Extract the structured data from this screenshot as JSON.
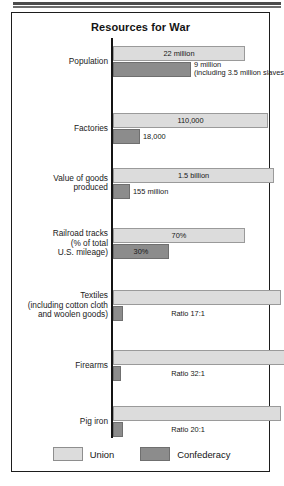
{
  "figure": {
    "title": "Resources for War"
  },
  "legend": {
    "position": "bottom-center",
    "items": [
      {
        "label": "Union",
        "color": "#dcdcdc",
        "name": "union"
      },
      {
        "label": "Confederacy",
        "color": "#8c8c8c",
        "name": "confederacy"
      }
    ]
  },
  "chart_data": {
    "type": "bar",
    "orientation": "horizontal",
    "title": "Resources for War",
    "xlabel": "",
    "ylabel": "",
    "grid": false,
    "legend_position": "bottom-center",
    "series": [
      {
        "name": "Union",
        "color": "#dcdcdc"
      },
      {
        "name": "Confederacy",
        "color": "#8c8c8c"
      }
    ],
    "categories": [
      "Population",
      "Factories",
      "Value of goods produced",
      "Railroad tracks (% of total U.S. mileage)",
      "Textiles (including cotton cloth and woolen goods)",
      "Firearms",
      "Pig iron"
    ],
    "rows": [
      {
        "category_label": "Population",
        "union": {
          "value": 22000000,
          "label": "22 million",
          "bar_length_px": 132,
          "label_placement": "inside"
        },
        "confederacy": {
          "value": 9000000,
          "label": "9 million\n(including 3.5 million slaves)",
          "bar_length_px": 78,
          "label_placement": "outside"
        },
        "ratio": null
      },
      {
        "category_label": "Factories",
        "union": {
          "value": 110000,
          "label": "110,000",
          "bar_length_px": 155,
          "label_placement": "inside"
        },
        "confederacy": {
          "value": 18000,
          "label": "18,000",
          "bar_length_px": 27,
          "label_placement": "outside"
        },
        "ratio": null
      },
      {
        "category_label": "Value of goods\nproduced",
        "union": {
          "value": 1500000000,
          "label": "1.5 billion",
          "bar_length_px": 161,
          "label_placement": "inside"
        },
        "confederacy": {
          "value": 155000000,
          "label": "155 million",
          "bar_length_px": 17,
          "label_placement": "outside"
        },
        "ratio": null
      },
      {
        "category_label": "Railroad tracks\n(% of total\nU.S. mileage)",
        "union": {
          "value": 70,
          "label": "70%",
          "bar_length_px": 132,
          "label_placement": "inside"
        },
        "confederacy": {
          "value": 30,
          "label": "30%",
          "bar_length_px": 56,
          "label_placement": "inside"
        },
        "ratio": null
      },
      {
        "category_label": "Textiles\n(including cotton cloth\nand woolen goods)",
        "union": {
          "value": 17,
          "label": "",
          "bar_length_px": 168,
          "label_placement": "none"
        },
        "confederacy": {
          "value": 1,
          "label": "",
          "bar_length_px": 10,
          "label_placement": "none"
        },
        "ratio": "Ratio 17:1"
      },
      {
        "category_label": "Firearms",
        "union": {
          "value": 32,
          "label": "",
          "bar_length_px": 172,
          "label_placement": "none"
        },
        "confederacy": {
          "value": 1,
          "label": "",
          "bar_length_px": 8,
          "label_placement": "none"
        },
        "ratio": "Ratio 32:1"
      },
      {
        "category_label": "Pig iron",
        "union": {
          "value": 20,
          "label": "",
          "bar_length_px": 168,
          "label_placement": "none"
        },
        "confederacy": {
          "value": 1,
          "label": "",
          "bar_length_px": 10,
          "label_placement": "none"
        },
        "ratio": "Ratio 20:1"
      }
    ]
  }
}
